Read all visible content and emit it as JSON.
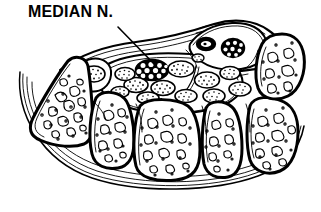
{
  "figure": {
    "title": "MEDIAN N.",
    "type": "anatomical-line-drawing",
    "background_color": "#ffffff",
    "ink_color": "#000000",
    "width": 321,
    "height": 212
  },
  "labels": [
    {
      "id": "median-n",
      "text": "MEDIAN N.",
      "x": 28,
      "y": 2,
      "leader_from_x": 118,
      "leader_from_y": 27,
      "leader_to_x": 156,
      "leader_to_y": 66
    }
  ],
  "structures": {
    "median_nerve": {
      "name": "median nerve",
      "style": "black oval with white fascicle dots",
      "cx": 152,
      "cy": 70,
      "rx": 16,
      "ry": 10,
      "fascicle_count": 11
    },
    "ulnar_nerve": {
      "name": "ulnar nerve",
      "style": "black oval with white fascicle dots",
      "cx": 232,
      "cy": 48,
      "rx": 11,
      "ry": 9,
      "fascicle_count": 8
    },
    "ulnar_artery": {
      "name": "ulnar artery",
      "style": "black ring with white lumen",
      "cx": 206,
      "cy": 44,
      "rx": 9,
      "ry": 6
    },
    "flexor_retinaculum": {
      "name": "flexor retinaculum",
      "style": "multi-line arc across the top"
    },
    "tendons": {
      "name": "flexor tendons",
      "style": "stippled ovals",
      "count": 13
    },
    "carpal_bones": {
      "name": "carpal bones",
      "style": "thick cortical outline with trabecular interior",
      "count": 7
    }
  },
  "palette": {
    "ink": "#000000",
    "paper": "#ffffff"
  }
}
